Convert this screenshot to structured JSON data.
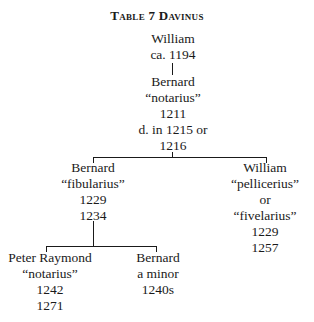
{
  "title": "Table 7  Davinus",
  "nodes": {
    "william_root": {
      "lines": [
        "William",
        "ca. 1194"
      ]
    },
    "bernard_notarius": {
      "lines": [
        "Bernard",
        "“notarius”",
        "1211",
        "d. in 1215 or",
        "1216"
      ]
    },
    "bernard_fibularius": {
      "lines": [
        "Bernard",
        "“fibularius”",
        "1229",
        "1234"
      ]
    },
    "william_pellicerius": {
      "lines": [
        "William",
        "“pellicerius”",
        "or",
        "“fivelarius”",
        "1229",
        "1257"
      ]
    },
    "peter_raymond": {
      "lines": [
        "Peter Raymond",
        "“notarius”",
        "1242",
        "1271"
      ]
    },
    "bernard_minor": {
      "lines": [
        "Bernard",
        "a minor",
        "1240s"
      ]
    }
  }
}
